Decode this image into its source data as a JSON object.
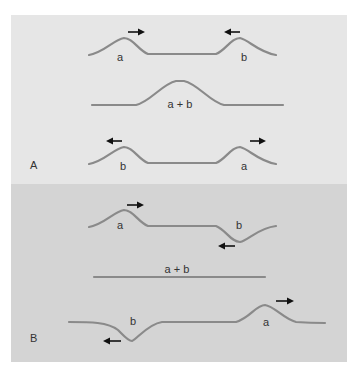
{
  "figure": {
    "colors": {
      "panel_a_bg": "#e6e6e6",
      "panel_b_bg": "#d4d4d4",
      "wave": "#8a8a8a",
      "arrow": "#111111",
      "text": "#333333"
    },
    "panel_a": {
      "label": "A",
      "row1": {
        "left_pulse": "a",
        "right_pulse": "b",
        "left_arrow": "right",
        "right_arrow": "left"
      },
      "row2": {
        "sum_label": "a + b"
      },
      "row3": {
        "left_pulse": "b",
        "right_pulse": "a",
        "left_arrow": "left",
        "right_arrow": "right"
      }
    },
    "panel_b": {
      "label": "B",
      "row1": {
        "left_pulse": "a",
        "right_pulse": "b",
        "left_arrow": "right",
        "right_arrow": "left"
      },
      "row2": {
        "sum_label": "a + b"
      },
      "row3": {
        "left_pulse": "b",
        "right_pulse": "a",
        "left_arrow": "left",
        "right_arrow": "right"
      }
    }
  }
}
